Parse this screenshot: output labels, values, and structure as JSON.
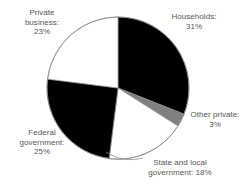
{
  "chart_data": {
    "type": "pie",
    "title": "",
    "subtitle": "",
    "xlabel": "",
    "ylabel": "",
    "grid": false,
    "legend_position": "none",
    "label_format": "{name}: {value}%",
    "start_angle_deg": 0,
    "direction": "clockwise",
    "categories": [
      "Households",
      "Other private",
      "State and local government",
      "Federal government",
      "Private business"
    ],
    "values": [
      31,
      3,
      18,
      25,
      23
    ],
    "total": 100,
    "units": "percent",
    "slices": [
      {
        "name": "Households",
        "value": 31,
        "value_label": "31%",
        "label_line1": "Households:",
        "label_line2": "31%",
        "color": "#000000",
        "start_deg": 0,
        "end_deg": 111.6
      },
      {
        "name": "Other private",
        "value": 3,
        "value_label": "3%",
        "label_line1": "Other private:",
        "label_line2": "3%",
        "color": "#808080",
        "start_deg": 111.6,
        "end_deg": 122.4
      },
      {
        "name": "State and local government",
        "value": 18,
        "value_label": "18%",
        "label_line1": "State and local",
        "label_line2": "government: 18%",
        "color": "#ffffff",
        "start_deg": 122.4,
        "end_deg": 187.2
      },
      {
        "name": "Federal government",
        "value": 25,
        "value_label": "25%",
        "label_line1": "Federal",
        "label_line2": "government:",
        "label_line3": "25%",
        "color": "#000000",
        "start_deg": 187.2,
        "end_deg": 277.2
      },
      {
        "name": "Private business",
        "value": 23,
        "value_label": "23%",
        "label_line1": "Private",
        "label_line2": "business:",
        "label_line3": "23%",
        "color": "#ffffff",
        "start_deg": 277.2,
        "end_deg": 360
      }
    ]
  },
  "labels": {
    "private_business": "Private\nbusiness:\n23%",
    "households": "Households:\n31%",
    "other_private": "Other private:\n3%",
    "federal_government": "Federal\ngovernment:\n25%",
    "state_and_local": "State and local\ngovernment: 18%"
  },
  "colors": {
    "dark_slice": "#000000",
    "gray_slice": "#808080",
    "light_slice": "#ffffff",
    "outline": "#8c8c8c",
    "text": "#565656",
    "background": "#ffffff"
  }
}
